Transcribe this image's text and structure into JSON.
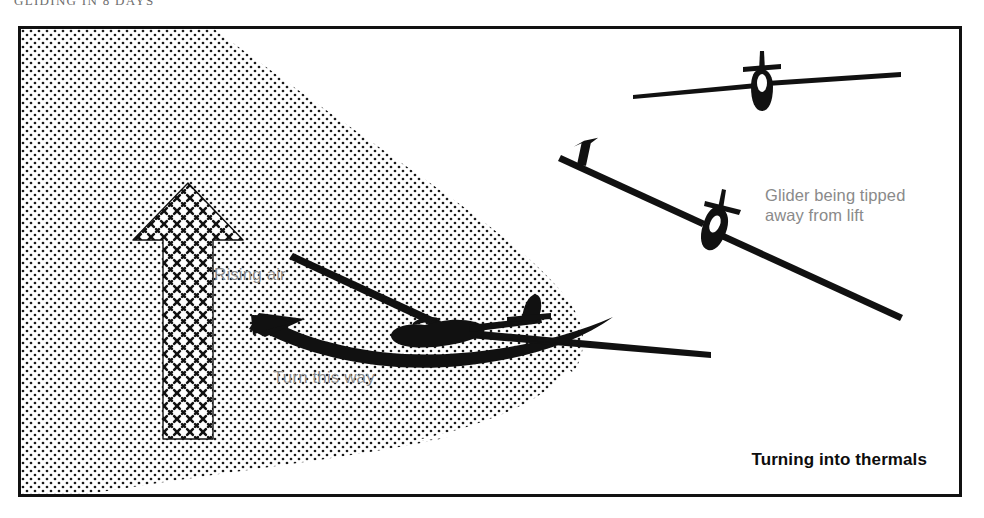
{
  "page": {
    "running_head": "GLIDING IN 8 DAYS"
  },
  "figure": {
    "caption": "Turning into thermals",
    "frame": {
      "border_color": "#111111",
      "background": "#ffffff"
    },
    "palette": {
      "ink": "#111111",
      "label_gray": "#8a8a8a",
      "caption_black": "#0d0d0d",
      "stipple_dot": "#1a1a1a",
      "arrow_hatch": "#111111"
    },
    "labels": [
      {
        "id": "rising-air",
        "text": "Rising air"
      },
      {
        "id": "turn-this-way",
        "text": "Turn this way"
      },
      {
        "id": "tipped",
        "text": "Glider being tipped\naway from lift"
      }
    ],
    "elements": [
      {
        "name": "thermal-region",
        "kind": "stippled-blob",
        "description": "Dot-stippled area of rising air filling the left two-thirds of the frame"
      },
      {
        "name": "rising-air-arrow",
        "kind": "hatched-arrow",
        "direction": "up"
      },
      {
        "name": "turn-this-way-arrow",
        "kind": "curved-arrow",
        "direction": "left"
      },
      {
        "name": "glider-centre",
        "kind": "glider",
        "view": "rear three-quarter, banking into the thermal"
      },
      {
        "name": "glider-top",
        "kind": "glider",
        "view": "head-on, wings level"
      },
      {
        "name": "glider-tipped",
        "kind": "glider",
        "view": "head-on, banked away from lift"
      },
      {
        "name": "lift-arrow",
        "kind": "solid-arrow",
        "direction": "up"
      }
    ]
  }
}
